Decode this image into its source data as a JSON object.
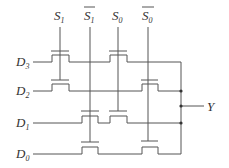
{
  "diagram": {
    "type": "4-to-1 multiplexer (transmission-gate / MOS switch tree)",
    "select_inputs": [
      {
        "name": "S",
        "sub": "1",
        "inverted": false
      },
      {
        "name": "S",
        "sub": "1",
        "inverted": true
      },
      {
        "name": "S",
        "sub": "0",
        "inverted": false
      },
      {
        "name": "S",
        "sub": "0",
        "inverted": true
      }
    ],
    "data_inputs": [
      {
        "name": "D",
        "sub": "3"
      },
      {
        "name": "D",
        "sub": "2"
      },
      {
        "name": "D",
        "sub": "1"
      },
      {
        "name": "D",
        "sub": "0"
      }
    ],
    "output": {
      "name": "Y"
    },
    "stroke_color": "#555555",
    "label_color": "#333333"
  }
}
